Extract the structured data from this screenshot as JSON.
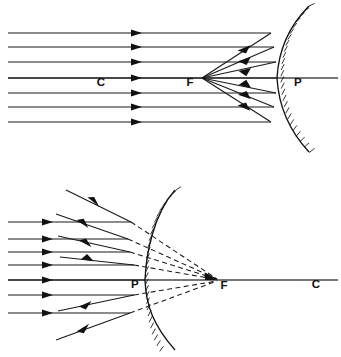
{
  "figure": {
    "background_color": "#ffffff",
    "ink_color": "#111111",
    "axis_color": "#4a4a4a",
    "width": 341,
    "height": 357
  },
  "diagrams": [
    {
      "id": "concave-mirror",
      "name": "Concave mirror — parallel rays converge at focal point F",
      "mirror_type": "concave",
      "mirror": {
        "vertex_x": 277,
        "vertex_y": 78,
        "top_x": 278,
        "top_y": 6,
        "bottom_x": 278,
        "bottom_y": 152,
        "bulge_direction": "right",
        "reflective_side": "left",
        "hatch_side": "right",
        "hatch_count": 30,
        "hatch_length": 6
      },
      "principal_axis": {
        "y": 78,
        "x_start": 8,
        "x_end": 338
      },
      "focus": {
        "label": "F",
        "x": 202,
        "y": 78,
        "label_x": 190,
        "label_y": 86
      },
      "center": {
        "label": "C",
        "x": 108,
        "y": 78,
        "label_x": 101,
        "label_y": 86
      },
      "pole": {
        "label": "P",
        "x": 277,
        "y": 78,
        "label_x": 296,
        "label_y": 86
      },
      "incident_rays": {
        "count": 7,
        "direction": "left-to-right",
        "x_start": 8,
        "ray_y_values": [
          33,
          47,
          62,
          78,
          93,
          107,
          122
        ],
        "arrow_x": 137
      },
      "reflected_rays": {
        "count": 6,
        "description": "rays reflect off mirror and converge on F",
        "arrow_position_fraction": 0.42
      }
    },
    {
      "id": "convex-mirror",
      "name": "Convex mirror — parallel rays diverge, appear to come from virtual focus F",
      "mirror_type": "convex",
      "mirror": {
        "vertex_x": 145,
        "vertex_y": 280,
        "top_x": 144,
        "top_y": 190,
        "bottom_x": 144,
        "bottom_y": 350,
        "bulge_direction": "left",
        "reflective_side": "left",
        "hatch_side": "right",
        "hatch_count": 30,
        "hatch_length": 6
      },
      "principal_axis": {
        "y": 280,
        "x_start": 8,
        "x_end": 338
      },
      "focus": {
        "label": "F",
        "x": 218,
        "y": 280,
        "label_x": 221,
        "label_y": 288
      },
      "center": {
        "label": "C",
        "x": 317,
        "y": 280,
        "label_x": 313,
        "label_y": 288
      },
      "pole": {
        "label": "P",
        "x": 145,
        "y": 280,
        "label_x": 133,
        "label_y": 288
      },
      "incident_rays": {
        "count": 7,
        "direction": "left-to-right",
        "x_start": 8,
        "ray_y_values": [
          222,
          239,
          252,
          265,
          280,
          295,
          313
        ],
        "arrow_x": 48
      },
      "reflected_rays": {
        "count": 6,
        "description": "rays reflect and diverge away from mirror toward upper-left and lower-left"
      },
      "virtual_rays": {
        "count": 6,
        "style": "dashed",
        "description": "dashed backward extensions converging at virtual focus F behind the mirror"
      }
    }
  ],
  "labels": {
    "center_of_curvature": "C",
    "focal_point": "F",
    "pole": "P"
  }
}
